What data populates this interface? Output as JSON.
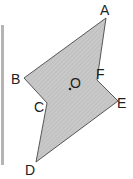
{
  "diagram": {
    "type": "polygon",
    "fill_color": "#c9c9c9",
    "hatch_color": "#b3b3b3",
    "stroke_color": "#333333",
    "left_bar_color": "#b4b4b4",
    "vertices": [
      {
        "name": "A",
        "x": 106,
        "y": 18
      },
      {
        "name": "F",
        "x": 97,
        "y": 80
      },
      {
        "name": "E",
        "x": 118,
        "y": 101
      },
      {
        "name": "D",
        "x": 36,
        "y": 162
      },
      {
        "name": "C",
        "x": 47,
        "y": 103
      },
      {
        "name": "B",
        "x": 24,
        "y": 78
      }
    ],
    "labels": {
      "A": "A",
      "B": "B",
      "C": "C",
      "D": "D",
      "E": "E",
      "F": "F",
      "O": "O"
    },
    "center": {
      "name": "O",
      "x": 70,
      "y": 89
    }
  }
}
